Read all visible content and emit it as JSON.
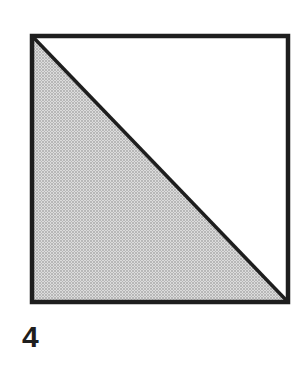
{
  "figure": {
    "label": "4",
    "shape": "square",
    "division": "diagonal from top-left to bottom-right",
    "shaded_region": "lower-left triangle",
    "colors": {
      "stroke": "#1e1e1e",
      "shade_dots": "#8a8a8a",
      "shade_base": "#dcdcdc",
      "background": "#ffffff"
    }
  }
}
